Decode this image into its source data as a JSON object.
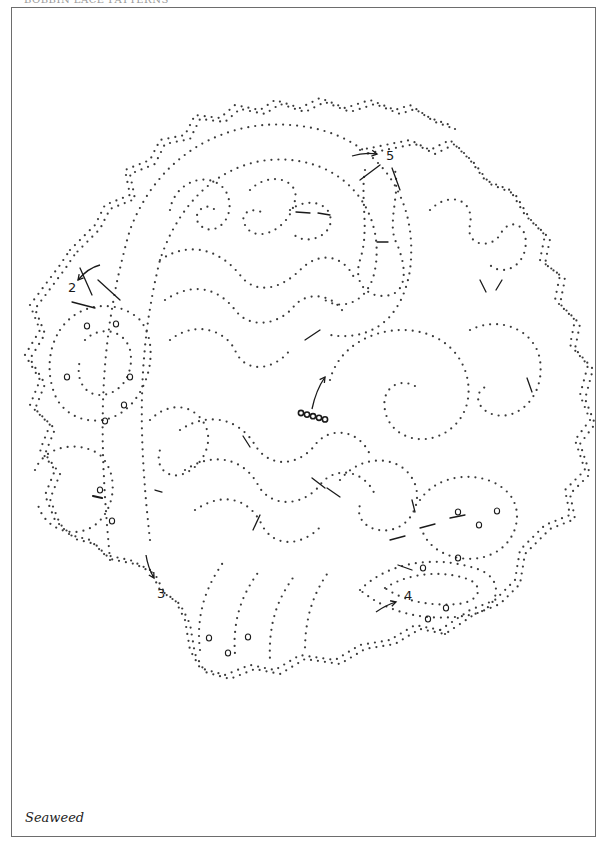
{
  "page": {
    "header_partial": "BOBBIN LACE PATTERNS",
    "caption": "Seaweed",
    "frame": {
      "x": 11,
      "y": 7,
      "w": 585,
      "h": 830
    },
    "colors": {
      "dots": "#3a3a3a",
      "ink": "#1a1a1a",
      "frame": "#6d6d6d"
    }
  },
  "pricking": {
    "dot_radius": 1.1,
    "dot_spacing": 7,
    "paths": [
      {
        "name": "outer-scallop-top",
        "d": "M70 250 L95 225 L105 205 L130 195 L125 170 L150 160 L160 140 L185 135 L195 115 L220 118 L235 105 L260 110 L275 100 L300 108 L320 98 L345 108 L370 100 L395 110 L410 105 L430 118 L450 125"
      },
      {
        "name": "outer-scallop-right",
        "d": "M360 150 L385 145 L410 140 L430 150 L450 140 L470 160 L485 180 L510 190 L525 215 L545 235 L540 260 L560 275 L555 300 L575 320 L570 345 L588 365 L580 395 L590 420 L575 440 L585 470 L565 490 L570 515 L545 525 L520 550 L515 580 L495 600 L470 610 L440 630"
      },
      {
        "name": "outer-scallop-bottom",
        "d": "M440 630 L415 625 L390 640 L360 645 L335 660 L300 655 L275 670 L250 665 L225 675 L200 668 L190 650 L185 620 L175 600 L160 590 L150 570 L130 560 L105 555 L90 540 L70 535 L55 520 L45 495 L55 470 L40 450 L50 425 L30 405 L40 380 L25 355 L40 330 L30 305 L45 285 L60 265 L70 250"
      },
      {
        "name": "big-paisley-outer",
        "d": "M110 560 C100 450 95 350 130 230 C160 150 230 120 290 125 C370 130 420 190 410 270 C400 330 360 340 330 335"
      },
      {
        "name": "big-paisley-inner",
        "d": "M150 540 C140 450 135 360 160 260 C185 185 240 155 290 160 C350 165 385 215 375 270 C368 305 340 310 325 300"
      },
      {
        "name": "curl-top-1",
        "d": "M170 210 C175 180 210 170 225 190 C240 215 215 240 200 225 C190 215 205 200 215 210"
      },
      {
        "name": "curl-top-2",
        "d": "M250 190 C270 170 300 180 295 200 C290 230 255 245 245 225 C238 212 255 205 265 215"
      },
      {
        "name": "curl-top-3",
        "d": "M290 210 C310 195 335 205 330 225 C325 240 300 245 292 232"
      },
      {
        "name": "wave-1",
        "d": "M160 260 C190 240 220 250 240 275 C255 295 280 290 300 270 C320 250 345 255 355 280"
      },
      {
        "name": "wave-2",
        "d": "M165 300 C195 280 220 290 235 310 C250 330 280 325 295 305 C310 290 335 295 345 315"
      },
      {
        "name": "wave-3",
        "d": "M170 340 C195 320 225 330 235 350 C245 375 275 370 290 350"
      },
      {
        "name": "center-spiral",
        "d": "M330 380 C340 340 390 320 430 335 C470 350 480 400 455 425 C430 450 390 440 385 410 C380 385 405 375 420 390"
      },
      {
        "name": "right-spiral",
        "d": "M470 330 C500 315 535 330 540 360 C545 395 520 420 495 415 C475 410 472 390 490 385"
      },
      {
        "name": "right-lobes",
        "d": "M430 210 C450 190 475 200 470 225 C465 245 490 250 500 235 C510 215 530 225 525 250 C520 270 500 275 490 265"
      },
      {
        "name": "top-right-column",
        "d": "M365 170 C360 200 370 230 360 260 C352 285 370 300 390 295 C410 290 405 260 395 240 C388 220 400 195 395 170"
      },
      {
        "name": "left-pod",
        "d": "M60 330 C80 300 120 300 140 320 C160 345 150 390 125 410 C100 430 65 420 55 395 C45 370 50 345 60 330"
      },
      {
        "name": "left-pod-inner",
        "d": "M85 340 C100 325 125 330 130 350 C135 375 120 395 100 395 C85 395 75 380 80 360"
      },
      {
        "name": "left-lower-pod",
        "d": "M35 470 C45 445 80 440 100 455 C120 475 115 510 95 525 C75 540 45 530 38 505"
      },
      {
        "name": "lower-waves-1",
        "d": "M180 430 C210 410 240 420 255 445 C270 470 300 465 315 445 C330 425 360 430 370 455"
      },
      {
        "name": "lower-waves-2",
        "d": "M185 470 C215 450 245 460 258 485 C272 510 305 505 320 485 C335 465 365 470 375 495"
      },
      {
        "name": "lower-waves-3",
        "d": "M195 510 C225 490 250 500 262 525 C275 550 305 545 322 525"
      },
      {
        "name": "bottom-fingers",
        "d": "M200 650 C195 610 210 580 225 560 M235 655 C232 615 245 590 260 570 M270 660 C268 620 280 595 295 575 M305 650 C305 615 315 590 330 570"
      },
      {
        "name": "right-lower-pod",
        "d": "M420 500 C440 470 490 470 510 495 C525 515 515 545 490 555 C465 565 430 555 422 530"
      },
      {
        "name": "bottom-right-leaf",
        "d": "M360 590 C390 560 440 555 480 570 C505 580 500 610 470 615 C430 622 390 615 360 590"
      },
      {
        "name": "bottom-right-leaf-inner",
        "d": "M385 588 C410 572 445 570 470 580 C485 588 478 602 458 604 C430 606 405 602 385 588"
      },
      {
        "name": "mid-left-channel",
        "d": "M150 420 C170 400 195 405 205 425 C215 445 200 470 180 475 C165 478 155 465 160 450"
      },
      {
        "name": "mid-right-channel",
        "d": "M340 480 C360 455 395 455 410 475 C425 495 415 525 390 530 C370 533 355 520 360 505"
      }
    ],
    "dashes": [
      {
        "x1": 80,
        "y1": 268,
        "x2": 92,
        "y2": 295
      },
      {
        "x1": 98,
        "y1": 280,
        "x2": 120,
        "y2": 300
      },
      {
        "x1": 72,
        "y1": 302,
        "x2": 95,
        "y2": 308
      },
      {
        "x1": 360,
        "y1": 180,
        "x2": 380,
        "y2": 165
      },
      {
        "x1": 392,
        "y1": 168,
        "x2": 400,
        "y2": 190
      },
      {
        "x1": 296,
        "y1": 212,
        "x2": 310,
        "y2": 213
      },
      {
        "x1": 318,
        "y1": 213,
        "x2": 330,
        "y2": 215
      },
      {
        "x1": 155,
        "y1": 490,
        "x2": 162,
        "y2": 492
      },
      {
        "x1": 305,
        "y1": 340,
        "x2": 320,
        "y2": 330
      },
      {
        "x1": 312,
        "y1": 478,
        "x2": 325,
        "y2": 488
      },
      {
        "x1": 327,
        "y1": 488,
        "x2": 340,
        "y2": 497
      },
      {
        "x1": 243,
        "y1": 436,
        "x2": 250,
        "y2": 447
      },
      {
        "x1": 260,
        "y1": 515,
        "x2": 253,
        "y2": 530
      },
      {
        "x1": 390,
        "y1": 540,
        "x2": 405,
        "y2": 536
      },
      {
        "x1": 420,
        "y1": 528,
        "x2": 435,
        "y2": 524
      },
      {
        "x1": 450,
        "y1": 518,
        "x2": 465,
        "y2": 515
      },
      {
        "x1": 412,
        "y1": 500,
        "x2": 415,
        "y2": 512
      },
      {
        "x1": 398,
        "y1": 565,
        "x2": 412,
        "y2": 570
      },
      {
        "x1": 527,
        "y1": 378,
        "x2": 532,
        "y2": 392
      },
      {
        "x1": 377,
        "y1": 242,
        "x2": 388,
        "y2": 242
      },
      {
        "x1": 480,
        "y1": 280,
        "x2": 486,
        "y2": 292
      },
      {
        "x1": 496,
        "y1": 290,
        "x2": 502,
        "y2": 280
      }
    ],
    "rings": [
      {
        "x": 87,
        "y": 326
      },
      {
        "x": 116,
        "y": 324
      },
      {
        "x": 67,
        "y": 377
      },
      {
        "x": 130,
        "y": 377
      },
      {
        "x": 124,
        "y": 405
      },
      {
        "x": 105,
        "y": 421
      },
      {
        "x": 100,
        "y": 490
      },
      {
        "x": 112,
        "y": 521
      },
      {
        "x": 209,
        "y": 638
      },
      {
        "x": 228,
        "y": 653
      },
      {
        "x": 248,
        "y": 637
      },
      {
        "x": 458,
        "y": 512
      },
      {
        "x": 479,
        "y": 525
      },
      {
        "x": 497,
        "y": 511
      },
      {
        "x": 458,
        "y": 558
      },
      {
        "x": 423,
        "y": 568
      },
      {
        "x": 428,
        "y": 619
      },
      {
        "x": 446,
        "y": 608
      }
    ],
    "start_marker": {
      "x": 301,
      "y": 413,
      "count": 5,
      "spacing": 6
    },
    "markers": [
      {
        "id": "marker-1",
        "label": "",
        "x": 98,
        "y": 496,
        "kind": "dash"
      },
      {
        "id": "marker-2",
        "label": "2",
        "x": 68,
        "y": 292,
        "arrow": {
          "from": [
            100,
            265
          ],
          "to": [
            78,
            280
          ],
          "curve": [
            88,
            268
          ]
        }
      },
      {
        "id": "marker-3",
        "label": "3",
        "x": 157,
        "y": 598,
        "arrow": {
          "from": [
            146,
            555
          ],
          "to": [
            154,
            578
          ],
          "curve": [
            148,
            568
          ]
        }
      },
      {
        "id": "marker-4",
        "label": "4",
        "x": 404,
        "y": 600,
        "arrow": {
          "from": [
            376,
            612
          ],
          "to": [
            396,
            602
          ],
          "curve": [
            386,
            605
          ]
        }
      },
      {
        "id": "marker-5",
        "label": "5",
        "x": 386,
        "y": 160,
        "arrow": {
          "from": [
            352,
            156
          ],
          "to": [
            377,
            154
          ],
          "curve": [
            364,
            152
          ]
        }
      },
      {
        "id": "start-arrow",
        "label": "",
        "x": 322,
        "y": 380,
        "arrow": {
          "from": [
            312,
            409
          ],
          "to": [
            325,
            377
          ],
          "curve": [
            316,
            390
          ]
        }
      }
    ]
  }
}
